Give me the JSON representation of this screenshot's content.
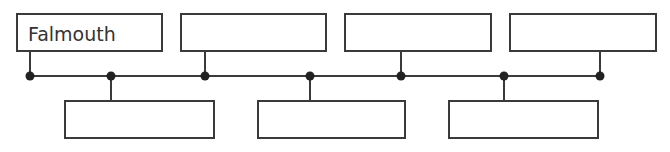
{
  "diagram": {
    "type": "timeline",
    "line_color": "#3a3a3a",
    "top_boxes": [
      {
        "label": "Falmouth",
        "x": 16,
        "w": 147
      },
      {
        "label": "",
        "x": 180,
        "w": 147
      },
      {
        "label": "",
        "x": 344,
        "w": 148
      },
      {
        "label": "",
        "x": 509,
        "w": 148
      }
    ],
    "bottom_boxes": [
      {
        "label": "",
        "x": 64,
        "w": 151
      },
      {
        "label": "",
        "x": 257,
        "w": 149
      },
      {
        "label": "",
        "x": 448,
        "w": 151
      }
    ],
    "dots_top": [
      30,
      205,
      401,
      600
    ],
    "dots_bottom": [
      111,
      310,
      504
    ]
  }
}
